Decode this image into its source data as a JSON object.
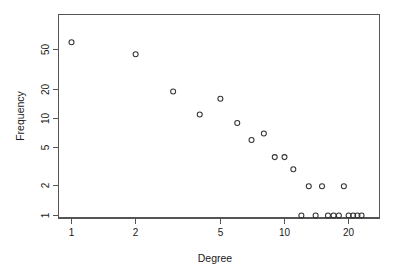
{
  "chart_data": {
    "type": "scatter",
    "title": "",
    "xlabel": "Degree",
    "ylabel": "Frequency",
    "xscale": "log",
    "yscale": "log",
    "grid": false,
    "legend": "none",
    "xlim": [
      0.88,
      26.5
    ],
    "ylim": [
      0.9,
      72
    ],
    "xticks": [
      1,
      2,
      5,
      10,
      20
    ],
    "xticklabels": [
      "1",
      "2",
      "5",
      "10",
      "20"
    ],
    "yticks": [
      1,
      2,
      5,
      10,
      20,
      50
    ],
    "yticklabels": [
      "1",
      "2",
      "5",
      "10",
      "20",
      "50"
    ],
    "marker": "open-circle",
    "marker_color": "#333333",
    "points": [
      {
        "x": 1,
        "y": 61
      },
      {
        "x": 2,
        "y": 46
      },
      {
        "x": 3,
        "y": 19
      },
      {
        "x": 4,
        "y": 11
      },
      {
        "x": 5,
        "y": 16
      },
      {
        "x": 6,
        "y": 9
      },
      {
        "x": 7,
        "y": 6
      },
      {
        "x": 8,
        "y": 7
      },
      {
        "x": 9,
        "y": 4
      },
      {
        "x": 10,
        "y": 4
      },
      {
        "x": 11,
        "y": 3
      },
      {
        "x": 12,
        "y": 1
      },
      {
        "x": 13,
        "y": 2
      },
      {
        "x": 14,
        "y": 1
      },
      {
        "x": 15,
        "y": 2
      },
      {
        "x": 16,
        "y": 1
      },
      {
        "x": 17,
        "y": 1
      },
      {
        "x": 18,
        "y": 1
      },
      {
        "x": 19,
        "y": 2
      },
      {
        "x": 20,
        "y": 1
      },
      {
        "x": 21,
        "y": 1
      },
      {
        "x": 22,
        "y": 1
      },
      {
        "x": 23,
        "y": 1
      }
    ],
    "x": [
      1,
      2,
      3,
      4,
      5,
      6,
      7,
      8,
      9,
      10,
      11,
      12,
      13,
      14,
      15,
      16,
      17,
      18,
      19,
      20,
      21,
      22,
      23
    ],
    "values": [
      61,
      46,
      19,
      11,
      16,
      9,
      6,
      7,
      4,
      4,
      3,
      1,
      2,
      1,
      2,
      1,
      1,
      1,
      2,
      1,
      1,
      1,
      1
    ]
  },
  "axes": {
    "x_title": "Degree",
    "y_title": "Frequency",
    "x_tick_labels": [
      "1",
      "2",
      "5",
      "10",
      "20"
    ],
    "y_tick_labels": [
      "1",
      "2",
      "5",
      "10",
      "20",
      "50"
    ]
  },
  "style": {
    "axis_color": "#555555",
    "point_color": "#333333",
    "text_color": "#1a1a1a",
    "background": "#ffffff"
  }
}
